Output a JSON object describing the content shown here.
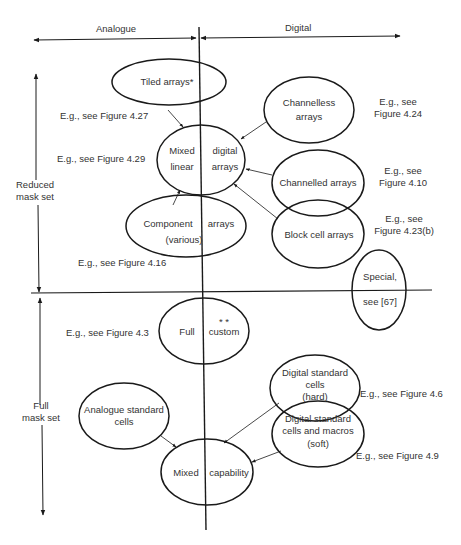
{
  "axes": {
    "horizontal": {
      "left_label": "Analogue",
      "right_label": "Digital"
    },
    "vertical": {
      "upper_label_line1": "Reduced",
      "upper_label_line2": "mask set",
      "lower_label_line1": "Full",
      "lower_label_line2": "mask set"
    }
  },
  "nodes": {
    "tiled_arrays": {
      "label": "Tiled arrays*",
      "ref": "E.g., see Figure 4.27"
    },
    "channelless_arrays": {
      "line1": "Channelless",
      "line2": "arrays",
      "ref_line1": "E.g., see",
      "ref_line2": "Figure 4.24"
    },
    "mixed_linear_digital_arrays": {
      "q1": "Mixed",
      "q2": "digital",
      "q3": "linear",
      "q4": "arrays",
      "ref": "E.g., see Figure 4.29"
    },
    "channelled_arrays": {
      "label": "Channelled arrays",
      "ref_line1": "E.g., see",
      "ref_line2": "Figure 4.10"
    },
    "component_arrays": {
      "left": "Component",
      "right": "arrays",
      "line2": "(various)",
      "ref": "E.g., see Figure 4.16"
    },
    "block_cell_arrays": {
      "label": "Block cell arrays",
      "ref_line1": "E.g., see",
      "ref_line2": "Figure 4.23(b)"
    },
    "special": {
      "line1": "Special,",
      "line2": "see [67]"
    },
    "full_custom": {
      "left": "Full",
      "right": "custom",
      "mark": "* *",
      "ref": "E.g., see Figure 4.3"
    },
    "digital_standard_cells_hard": {
      "line1": "Digital standard",
      "line2": "cells",
      "line3": "(hard)",
      "ref": "E.g., see Figure 4.6"
    },
    "analogue_standard_cells": {
      "line1": "Analogue standard",
      "line2": "cells"
    },
    "digital_standard_cells_macros_soft": {
      "line1": "Digital standard",
      "line2": "cells and macros",
      "line3": "(soft)",
      "ref": "E.g., see Figure 4.9"
    },
    "mixed_capability": {
      "left": "Mixed",
      "right": "capability"
    }
  },
  "colors": {
    "ink": "#1a1a1a",
    "text": "#333333",
    "background": "#ffffff"
  }
}
